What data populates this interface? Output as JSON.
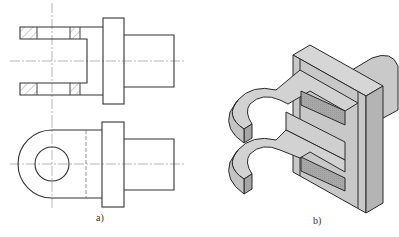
{
  "figure": {
    "views": [
      {
        "id": "a",
        "label": "a)",
        "description": "Orthographic views of clevis (fork) part: sectioned top view and front view"
      },
      {
        "id": "b",
        "label": "b)",
        "description": "Isometric sectioned view of clevis part"
      }
    ]
  },
  "colors": {
    "line": "#333333",
    "center_line": "#888888",
    "face_top": "#d4d4d4",
    "face_side": "#bdbdbd",
    "face_cut": "#a9a9a9",
    "background": "#ffffff"
  }
}
